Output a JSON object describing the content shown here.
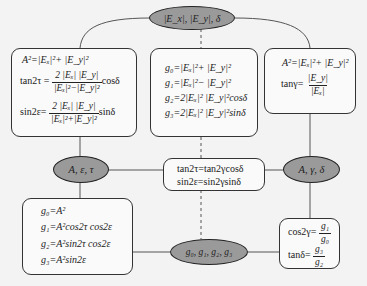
{
  "diagram": {
    "top_node": {
      "label": "|E_x|, |E_y|, δ"
    },
    "left_ellipse": {
      "label": "A, ε, τ"
    },
    "right_ellipse": {
      "label": "A, γ, δ"
    },
    "bottom_ellipse": {
      "label": "g₀, g₁, g₂, g₃"
    },
    "box_top_left": {
      "line1": "A²=|Eₓ|²+ |E_y|²",
      "line2_lhs": "tan2τ =",
      "line2_num": "2 |Eₓ| |E_y|",
      "line2_den": "|Eₓ|²−|E_y|²",
      "line2_tail": "cosδ",
      "line3_lhs": "sin2ε=",
      "line3_num": "2 |Eₓ| |E_y|",
      "line3_den": "|Eₓ|²+|E_y|²",
      "line3_tail": "sinδ"
    },
    "box_top_middle": {
      "lines": [
        "g₀=|Eₓ|²+ |E_y|²",
        "g₁=|Eₓ|²− |E_y|²",
        "g₂=2|Eₓ|² |E_y|²cosδ",
        "g₃=2|Eₓ|² |E_y|²sinδ"
      ]
    },
    "box_top_right": {
      "line1": "A²=|Eₓ|²+ |E_y|²",
      "line2_lhs": "tanγ=",
      "line2_num": "|E_y|",
      "line2_den": "|Eₓ|"
    },
    "box_center": {
      "lines": [
        "tan2τ=tan2γcosδ",
        "sin2ε=sin2γsinδ"
      ]
    },
    "box_bottom_left": {
      "lines": [
        "g₀=A²",
        "g₁=A²cos2τ cos2ε",
        "g₂=A²sin2τ cos2ε",
        "g₃=A²sin2ε"
      ]
    },
    "box_bottom_right": {
      "line1_lhs": "cos2γ=",
      "line1_num": "g₁",
      "line1_den": "g₀",
      "line2_lhs": "tanδ=",
      "line2_num": "g₃",
      "line2_den": "g₂"
    },
    "colors": {
      "background": "#f3f3f3",
      "ellipse_fill": "#9a9a9a",
      "stroke": "#333333"
    }
  }
}
